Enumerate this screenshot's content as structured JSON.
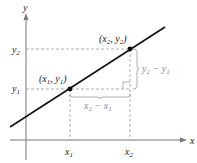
{
  "diagram": {
    "type": "slope-of-line",
    "axes": {
      "x_label": "x",
      "y_label": "y"
    },
    "points": [
      {
        "name": "point-1",
        "label": "(x1, y1)",
        "x_label": "x1",
        "y_label": "y1"
      },
      {
        "name": "point-2",
        "label": "(x2, y2)",
        "x_label": "x2",
        "y_label": "y2"
      }
    ],
    "run_label": "x2 − x1",
    "rise_label": "y2 − y1"
  },
  "labels": {
    "x": "x",
    "y": "y",
    "x_main": "x",
    "y_main": "y",
    "sub1": "1",
    "sub2": "2",
    "minus": " − ",
    "lparen": "(",
    "rparen": ")",
    "comma": ", "
  },
  "colors": {
    "line": "#111111",
    "axes": "#777777",
    "dashed": "#999999",
    "text": "#222222",
    "annotation": "#888888"
  }
}
